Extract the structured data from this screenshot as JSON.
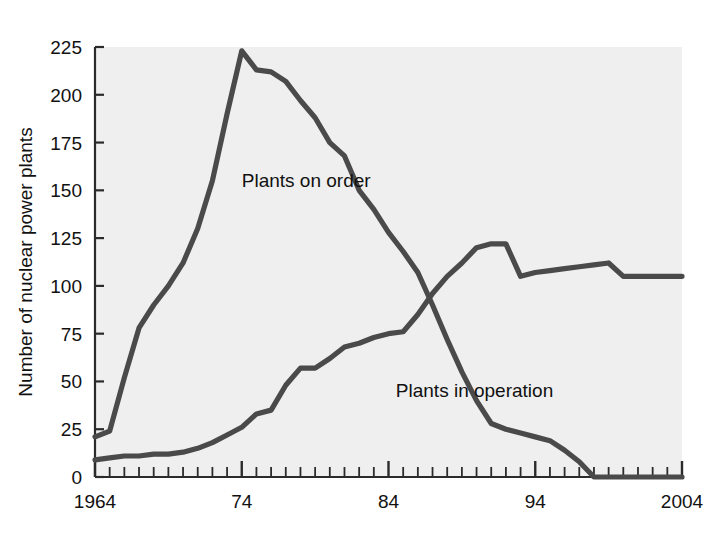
{
  "chart_data": {
    "type": "line",
    "title": "",
    "xlabel": "",
    "ylabel": "Number of nuclear power plants",
    "xlim": [
      1964,
      2004
    ],
    "ylim": [
      0,
      225
    ],
    "grid": false,
    "legend_position": "inline-annotations",
    "y_ticks": [
      0,
      25,
      50,
      75,
      100,
      125,
      150,
      175,
      200,
      225
    ],
    "y_tick_labels": [
      "0",
      "25",
      "50",
      "75",
      "100",
      "125",
      "150",
      "175",
      "200",
      "225"
    ],
    "x_ticks": [
      1964,
      1974,
      1984,
      1994,
      2004
    ],
    "x_tick_labels": [
      "1964",
      "74",
      "84",
      "94",
      "2004"
    ],
    "x_minor_tick_step": 1,
    "line_color": "#4a4a4a",
    "plot_bg": "#efefef",
    "axis_color": "#2b2b2b",
    "series": [
      {
        "name": "Plants on order",
        "label_text": "Plants on order",
        "x": [
          1964,
          1965,
          1966,
          1967,
          1968,
          1969,
          1970,
          1971,
          1972,
          1973,
          1974,
          1975,
          1976,
          1977,
          1978,
          1979,
          1980,
          1981,
          1982,
          1983,
          1984,
          1985,
          1986,
          1987,
          1988,
          1989,
          1990,
          1991,
          1992,
          1993,
          1994,
          1995,
          1996,
          1997,
          1998,
          1999,
          2000,
          2001,
          2002,
          2003,
          2004
        ],
        "values": [
          21,
          24,
          52,
          78,
          90,
          100,
          112,
          130,
          155,
          190,
          223,
          213,
          212,
          207,
          197,
          188,
          175,
          168,
          150,
          140,
          128,
          118,
          107,
          90,
          72,
          55,
          40,
          28,
          25,
          23,
          21,
          19,
          14,
          8,
          0,
          0,
          0,
          0,
          0,
          0,
          0
        ]
      },
      {
        "name": "Plants in operation",
        "label_text": "Plants in operation",
        "x": [
          1964,
          1965,
          1966,
          1967,
          1968,
          1969,
          1970,
          1971,
          1972,
          1973,
          1974,
          1975,
          1976,
          1977,
          1978,
          1979,
          1980,
          1981,
          1982,
          1983,
          1984,
          1985,
          1986,
          1987,
          1988,
          1989,
          1990,
          1991,
          1992,
          1993,
          1994,
          1995,
          1996,
          1997,
          1998,
          1999,
          2000,
          2001,
          2002,
          2003,
          2004
        ],
        "values": [
          9,
          10,
          11,
          11,
          12,
          12,
          13,
          15,
          18,
          22,
          26,
          33,
          35,
          48,
          57,
          57,
          62,
          68,
          70,
          73,
          75,
          76,
          85,
          96,
          105,
          112,
          120,
          122,
          122,
          105,
          107,
          108,
          109,
          110,
          111,
          112,
          105,
          105,
          105,
          105,
          105
        ]
      }
    ],
    "annotations": [
      {
        "text": "Plants on order",
        "x": 1974,
        "y": 152
      },
      {
        "text": "Plants in operation",
        "x": 1984.5,
        "y": 42
      }
    ]
  },
  "geometry": {
    "plot_left": 95,
    "plot_right": 682,
    "plot_top": 47,
    "plot_bottom": 477
  }
}
